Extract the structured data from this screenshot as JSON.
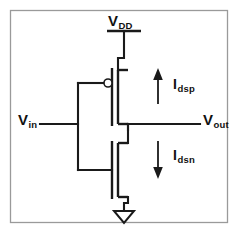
{
  "figure": {
    "kind": "cmos-inverter-schematic",
    "background_color": "#ffffff",
    "line_color": "#1a1a1a",
    "border_color": "#9a9a9a"
  },
  "labels": {
    "supply": {
      "base": "V",
      "sub": "DD",
      "name": "supply-rail-label"
    },
    "input": {
      "base": "V",
      "sub": "in",
      "name": "input-node-label"
    },
    "output": {
      "base": "V",
      "sub": "out",
      "name": "output-node-label"
    },
    "current_pmos": {
      "base": "I",
      "sub": "dsp",
      "name": "pmos-current-label"
    },
    "current_nmos": {
      "base": "I",
      "sub": "dsn",
      "name": "nmos-current-label"
    }
  },
  "devices": [
    {
      "id": "pmos",
      "type": "p-channel-mosfet",
      "has_inversion_bubble": true,
      "source_net": "VDD",
      "drain_net": "Vout",
      "gate_net": "Vin"
    },
    {
      "id": "nmos",
      "type": "n-channel-mosfet",
      "has_inversion_bubble": false,
      "source_net": "GND",
      "drain_net": "Vout",
      "gate_net": "Vin"
    }
  ],
  "nets": [
    "VDD",
    "Vin",
    "Vout",
    "GND"
  ],
  "currents": [
    {
      "id": "Idsp",
      "direction": "up",
      "through": "pmos"
    },
    {
      "id": "Idsn",
      "direction": "down",
      "through": "nmos"
    }
  ],
  "ground": {
    "symbol": "open-triangle",
    "net": "GND"
  }
}
